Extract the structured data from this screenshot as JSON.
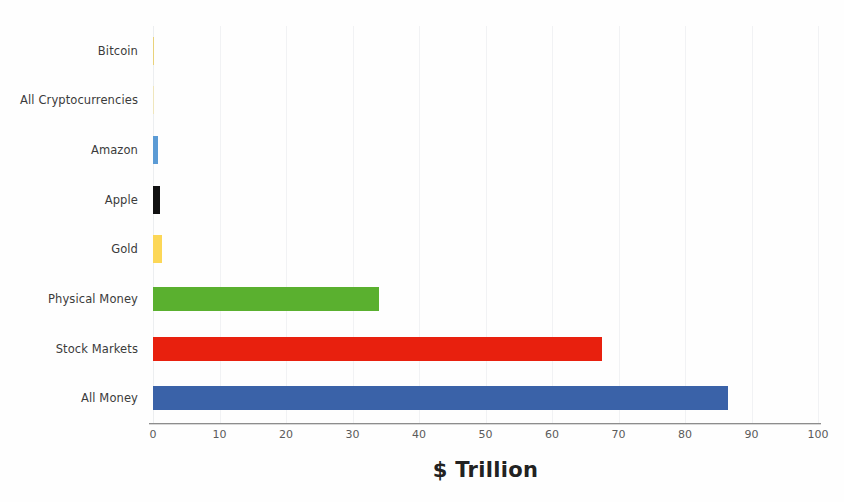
{
  "chart_data": {
    "type": "bar",
    "orientation": "horizontal",
    "title": "",
    "xlabel": "$ Trillion",
    "ylabel": "",
    "xlim": [
      0,
      100
    ],
    "xticks": [
      0,
      10,
      20,
      30,
      40,
      50,
      60,
      70,
      80,
      90,
      100
    ],
    "grid": true,
    "legend": "none",
    "categories": [
      "Bitcoin",
      "All Cryptocurrencies",
      "Amazon",
      "Apple",
      "Gold",
      "Physical Money",
      "Stock Markets",
      "All Money"
    ],
    "values": [
      0.2,
      0.15,
      0.8,
      1.1,
      1.3,
      34,
      67.5,
      86.5
    ],
    "colors": [
      "#e9d27a",
      "#efe6bd",
      "#5b9bd5",
      "#111111",
      "#fcd757",
      "#5ab02f",
      "#e8200e",
      "#3a62a8"
    ],
    "bars": [
      {
        "label": "Bitcoin",
        "value": 0.2,
        "color": "#e9d27a"
      },
      {
        "label": "All Cryptocurrencies",
        "value": 0.15,
        "color": "#efe6bd"
      },
      {
        "label": "Amazon",
        "value": 0.8,
        "color": "#5b9bd5"
      },
      {
        "label": "Apple",
        "value": 1.1,
        "color": "#111111"
      },
      {
        "label": "Gold",
        "value": 1.3,
        "color": "#fcd757"
      },
      {
        "label": "Physical Money",
        "value": 34,
        "color": "#5ab02f"
      },
      {
        "label": "Stock Markets",
        "value": 67.5,
        "color": "#e8200e"
      },
      {
        "label": "All Money",
        "value": 86.5,
        "color": "#3a62a8"
      }
    ]
  }
}
